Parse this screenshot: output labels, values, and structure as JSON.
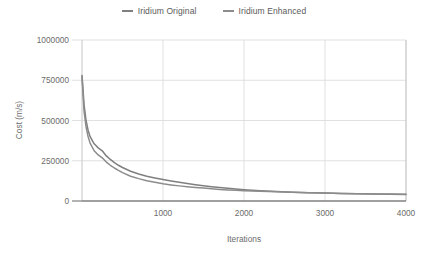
{
  "chart_data": {
    "type": "line",
    "title": "",
    "xlabel": "Iterations",
    "ylabel": "Cost (m/s)",
    "xlim": [
      0,
      4000
    ],
    "ylim": [
      0,
      1000000
    ],
    "xticks": [
      1000,
      2000,
      3000,
      4000
    ],
    "yticks": [
      0,
      250000,
      500000,
      750000,
      1000000
    ],
    "xtick_labels": [
      "1000",
      "2000",
      "3000",
      "4000"
    ],
    "ytick_labels": [
      "0",
      "250000",
      "500000",
      "750000",
      "1000000"
    ],
    "grid": true,
    "legend_position": "top-center",
    "x": [
      0,
      25,
      50,
      75,
      100,
      150,
      200,
      250,
      300,
      350,
      400,
      450,
      500,
      600,
      700,
      800,
      900,
      1000,
      1100,
      1200,
      1300,
      1400,
      1500,
      1600,
      1700,
      1800,
      1900,
      2000,
      2200,
      2400,
      2600,
      2800,
      3000,
      3200,
      3400,
      3600,
      3800,
      4000
    ],
    "series": [
      {
        "name": "Iridium Original",
        "color": "#7f7f7f",
        "values": [
          780000,
          600000,
          500000,
          440000,
          400000,
          355000,
          330000,
          312000,
          280000,
          258000,
          238000,
          222000,
          208000,
          185000,
          168000,
          154000,
          143000,
          133000,
          124000,
          116000,
          108000,
          101000,
          95000,
          89000,
          84000,
          79000,
          74000,
          70000,
          64000,
          59000,
          55000,
          52000,
          49000,
          47000,
          45000,
          43000,
          42000,
          41000
        ]
      },
      {
        "name": "Iridium Enhanced",
        "color": "#8c8c8c",
        "values": [
          770000,
          560000,
          460000,
          400000,
          360000,
          312000,
          286000,
          268000,
          242000,
          222000,
          205000,
          190000,
          176000,
          154000,
          139000,
          126000,
          116000,
          107000,
          100000,
          94000,
          89000,
          84000,
          80000,
          76000,
          72000,
          69000,
          66000,
          64000,
          60000,
          57000,
          54000,
          51000,
          49000,
          47000,
          45000,
          44000,
          43000,
          42000
        ]
      }
    ]
  },
  "legend": {
    "items": [
      {
        "label": "Iridium Original"
      },
      {
        "label": "Iridium Enhanced"
      }
    ]
  },
  "colors": {
    "series_original": "#7f7f7f",
    "series_enhanced": "#8c8c8c",
    "grid": "#d9d9d9",
    "axis": "#bfbfbf",
    "text": "#6b6b6b",
    "background": "#ffffff"
  }
}
